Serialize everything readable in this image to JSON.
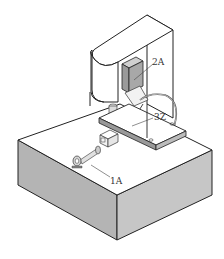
{
  "figure": {
    "labels": [
      {
        "id": "2A",
        "text": "2A",
        "x": 152,
        "y": 65
      },
      {
        "id": "3Z",
        "text": "3Z",
        "x": 154,
        "y": 120
      },
      {
        "id": "1A",
        "text": "1A",
        "x": 110,
        "y": 184
      }
    ],
    "colors": {
      "line": "#222222",
      "side_shade": "#b4b4b4",
      "front_shade": "#c6c6c6",
      "component_gray": "#9a9a9a",
      "top_face": "#ffffff",
      "background": "#ffffff"
    }
  }
}
